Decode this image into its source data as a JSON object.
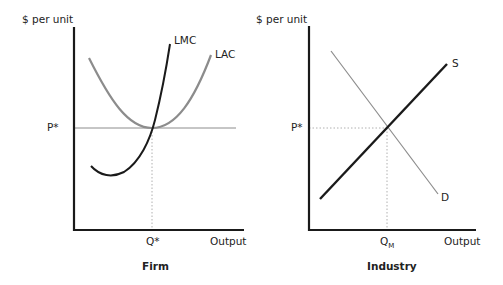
{
  "colors": {
    "axis": "#1a1a1a",
    "dark_curve": "#1a1a1a",
    "gray_curve": "#8c8c8c",
    "price_line": "#8c8c8c",
    "guide": "#b0b0b0"
  },
  "firm": {
    "title": "Firm",
    "y_label": "$ per unit",
    "x_label": "Output",
    "price_label": "P*",
    "quantity_label": "Q*",
    "curves": [
      {
        "name": "LMC",
        "label": "LMC",
        "style": "dark"
      },
      {
        "name": "LAC",
        "label": "LAC",
        "style": "gray"
      }
    ]
  },
  "industry": {
    "title": "Industry",
    "y_label": "$ per unit",
    "x_label": "Output",
    "price_label": "P*",
    "quantity_label": "Q",
    "quantity_subscript": "M",
    "curves": [
      {
        "name": "S",
        "label": "S",
        "style": "dark"
      },
      {
        "name": "D",
        "label": "D",
        "style": "gray"
      }
    ]
  }
}
